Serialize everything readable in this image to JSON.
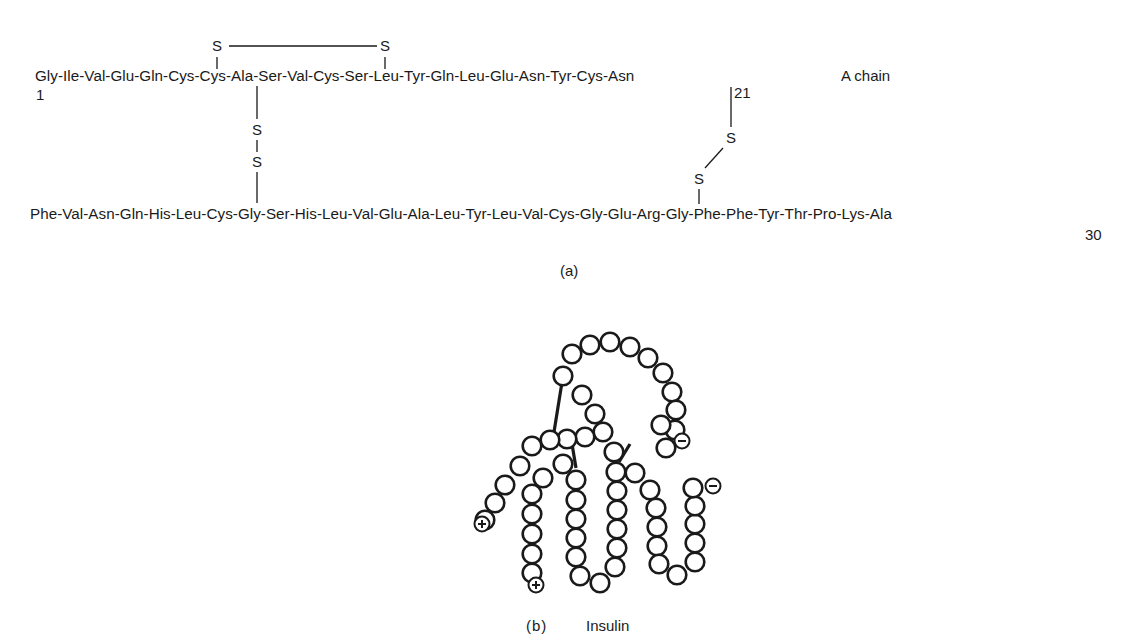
{
  "panel_a": {
    "label": "(a)",
    "a_chain": {
      "sequence": "Gly-Ile-Val-Glu-Gln-Cys-Cys-Ala-Ser-Val-Cys-Ser-Leu-Tyr-Gln-Leu-Glu-Asn-Tyr-Cys-Asn",
      "start_number": "1",
      "end_number": "21",
      "name": "A chain"
    },
    "b_chain": {
      "sequence": "Phe-Val-Asn-Gln-His-Leu-Cys-Gly-Ser-His-Leu-Val-Glu-Ala-Leu-Tyr-Leu-Val-Cys-Gly-Glu-Arg-Gly-Phe-Phe-Tyr-Thr-Pro-Lys-Ala",
      "end_number": "30"
    },
    "sulfur_symbol": "S",
    "disulfide_bonds": [
      {
        "from": "A6 Cys",
        "to": "A11 Cys",
        "type": "intrachain"
      },
      {
        "from": "A7 Cys",
        "to": "B7 Cys",
        "type": "interchain"
      },
      {
        "from": "A20 Cys",
        "to": "B19 Cys",
        "type": "interchain"
      }
    ]
  },
  "panel_b": {
    "label": "(b)",
    "title": "Insulin",
    "charges": [
      {
        "symbol": "+",
        "x": 482,
        "y": 524
      },
      {
        "symbol": "+",
        "x": 536,
        "y": 585
      },
      {
        "symbol": "−",
        "x": 682,
        "y": 441
      },
      {
        "symbol": "−",
        "x": 713,
        "y": 486
      }
    ],
    "residues": [
      [
        563,
        376
      ],
      [
        572,
        354
      ],
      [
        590,
        345
      ],
      [
        610,
        342
      ],
      [
        630,
        347
      ],
      [
        648,
        358
      ],
      [
        663,
        373
      ],
      [
        672,
        392
      ],
      [
        676,
        410
      ],
      [
        675,
        430
      ],
      [
        666,
        448
      ],
      [
        661,
        425
      ],
      [
        582,
        395
      ],
      [
        595,
        414
      ],
      [
        603,
        432
      ],
      [
        585,
        437
      ],
      [
        567,
        439
      ],
      [
        550,
        440
      ],
      [
        532,
        446
      ],
      [
        520,
        466
      ],
      [
        505,
        485
      ],
      [
        495,
        503
      ],
      [
        485,
        520
      ],
      [
        543,
        478
      ],
      [
        532,
        494
      ],
      [
        532,
        514
      ],
      [
        532,
        534
      ],
      [
        532,
        554
      ],
      [
        532,
        573
      ],
      [
        563,
        464
      ],
      [
        576,
        480
      ],
      [
        576,
        500
      ],
      [
        576,
        519
      ],
      [
        576,
        538
      ],
      [
        576,
        557
      ],
      [
        580,
        576
      ],
      [
        600,
        583
      ],
      [
        615,
        567
      ],
      [
        617,
        548
      ],
      [
        617,
        529
      ],
      [
        617,
        510
      ],
      [
        617,
        491
      ],
      [
        616,
        472
      ],
      [
        614,
        452
      ],
      [
        635,
        473
      ],
      [
        650,
        490
      ],
      [
        656,
        508
      ],
      [
        657,
        527
      ],
      [
        657,
        546
      ],
      [
        659,
        564
      ],
      [
        677,
        575
      ],
      [
        695,
        562
      ],
      [
        695,
        543
      ],
      [
        695,
        524
      ],
      [
        695,
        506
      ],
      [
        693,
        488
      ]
    ],
    "crosslinks": [
      {
        "x1": 563,
        "y1": 376,
        "x2": 554,
        "y2": 432
      },
      {
        "x1": 572,
        "y1": 444,
        "x2": 576,
        "y2": 468
      },
      {
        "x1": 630,
        "y1": 444,
        "x2": 619,
        "y2": 462
      }
    ]
  }
}
